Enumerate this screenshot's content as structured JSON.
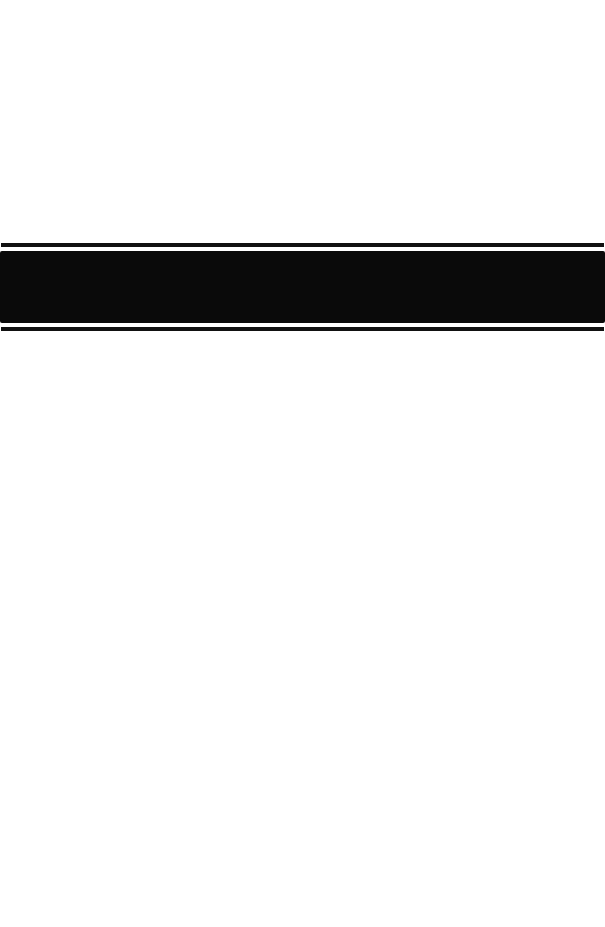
{
  "page": {
    "background_color": "#ffffff"
  },
  "band": {
    "color": "#0a0a0a",
    "line_color": "#111111"
  }
}
